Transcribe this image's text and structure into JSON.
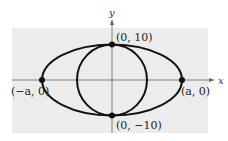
{
  "diagram": {
    "axes": {
      "x_label": "x",
      "y_label": "y"
    },
    "colors": {
      "background": "#ececec",
      "curve": "#111111",
      "axis": "#666666"
    },
    "curves": [
      {
        "name": "ellipse",
        "center": [
          0,
          0
        ],
        "semi_major": "a",
        "semi_minor": 10
      },
      {
        "name": "circle",
        "center": [
          0,
          0
        ],
        "radius": 10
      }
    ],
    "points": [
      {
        "label": "(0, 10)",
        "x": "0",
        "y": 10
      },
      {
        "label": "(0, −10)",
        "x": "0",
        "y": -10
      },
      {
        "label": "(−a, 0)",
        "x": "-a",
        "y": 0
      },
      {
        "label": "(a, 0)",
        "x": "a",
        "y": 0
      }
    ]
  }
}
